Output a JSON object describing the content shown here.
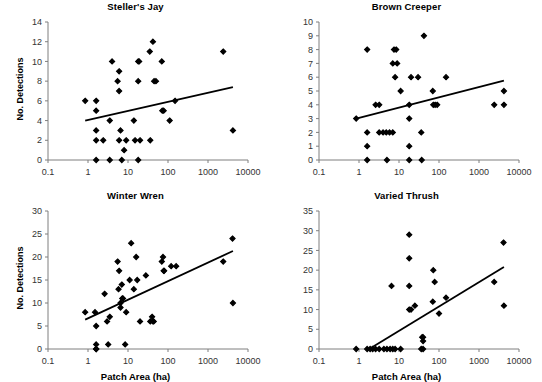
{
  "figure": {
    "width": 542,
    "height": 378,
    "background": "#ffffff",
    "marker_color": "#000000",
    "line_color": "#000000",
    "axis_color": "#7f7f7f",
    "tick_label_color": "#333333"
  },
  "axis_common": {
    "xlabel": "Patch Area (ha)",
    "ylabel": "No. Detections",
    "x_scale": "log",
    "x_ticks": [
      0.1,
      1,
      10,
      100,
      1000,
      10000
    ],
    "x_tick_labels": [
      "0.1",
      "1",
      "10",
      "100",
      "1000",
      "10000"
    ],
    "xlim": [
      0.1,
      10000
    ],
    "grid": false,
    "legend": false
  },
  "chart_data": [
    {
      "id": "stellers-jay",
      "type": "scatter",
      "title": "Steller's Jay",
      "xlabel": "",
      "ylabel": "No. Detections",
      "x_scale": "log",
      "xlim": [
        0.1,
        10000
      ],
      "ylim": [
        0,
        14
      ],
      "y_ticks": [
        0,
        2,
        4,
        6,
        8,
        10,
        12,
        14
      ],
      "y_tick_labels": [
        "0",
        "2",
        "4",
        "6",
        "8",
        "10",
        "12",
        "14"
      ],
      "x_ticks": [
        0.1,
        1,
        10,
        100,
        1000,
        10000
      ],
      "x_tick_labels": [
        "0.1",
        "1",
        "10",
        "100",
        "1000",
        "10000"
      ],
      "show_xlabel": false,
      "points": [
        [
          0.85,
          6
        ],
        [
          1.6,
          6
        ],
        [
          1.6,
          5
        ],
        [
          1.6,
          3
        ],
        [
          1.6,
          2
        ],
        [
          1.6,
          0
        ],
        [
          2.4,
          2
        ],
        [
          3.5,
          4
        ],
        [
          3.5,
          0
        ],
        [
          4.0,
          10
        ],
        [
          5.5,
          8
        ],
        [
          6.0,
          9
        ],
        [
          6.0,
          7
        ],
        [
          6.0,
          2
        ],
        [
          6.5,
          3
        ],
        [
          7.0,
          0
        ],
        [
          8.0,
          1
        ],
        [
          9.0,
          2
        ],
        [
          14,
          4
        ],
        [
          15,
          2
        ],
        [
          18,
          10
        ],
        [
          18,
          8
        ],
        [
          18,
          0
        ],
        [
          19,
          10
        ],
        [
          20,
          2
        ],
        [
          35,
          11
        ],
        [
          36,
          2
        ],
        [
          42,
          12
        ],
        [
          45,
          8
        ],
        [
          50,
          8
        ],
        [
          70,
          10
        ],
        [
          72,
          5
        ],
        [
          78,
          5
        ],
        [
          110,
          4
        ],
        [
          150,
          6
        ],
        [
          2400,
          11
        ],
        [
          4200,
          3
        ]
      ],
      "trend_line": {
        "x_start": 0.85,
        "y_start": 4.0,
        "x_end": 4200,
        "y_end": 7.4
      }
    },
    {
      "id": "brown-creeper",
      "type": "scatter",
      "title": "Brown Creeper",
      "xlabel": "",
      "ylabel": "",
      "x_scale": "log",
      "xlim": [
        0.1,
        10000
      ],
      "ylim": [
        0,
        10
      ],
      "y_ticks": [
        0,
        1,
        2,
        3,
        4,
        5,
        6,
        7,
        8,
        9,
        10
      ],
      "y_tick_labels": [
        "0",
        "1",
        "2",
        "3",
        "4",
        "5",
        "6",
        "7",
        "8",
        "9",
        "10"
      ],
      "x_ticks": [
        0.1,
        1,
        10,
        100,
        1000,
        10000
      ],
      "x_tick_labels": [
        "0.1",
        "1",
        "10",
        "100",
        "1000",
        "10000"
      ],
      "show_xlabel": false,
      "points": [
        [
          0.85,
          3
        ],
        [
          1.6,
          8
        ],
        [
          1.6,
          2
        ],
        [
          1.6,
          1
        ],
        [
          1.6,
          0
        ],
        [
          2.6,
          4
        ],
        [
          3.2,
          4
        ],
        [
          3.2,
          2
        ],
        [
          4.0,
          2
        ],
        [
          4.8,
          2
        ],
        [
          5.0,
          0
        ],
        [
          5.8,
          2
        ],
        [
          7.0,
          2
        ],
        [
          7.5,
          8
        ],
        [
          8.5,
          8
        ],
        [
          7.0,
          7
        ],
        [
          8.0,
          6
        ],
        [
          9.0,
          7
        ],
        [
          11,
          5
        ],
        [
          18,
          4
        ],
        [
          18,
          3
        ],
        [
          18,
          1
        ],
        [
          18,
          0
        ],
        [
          20,
          6
        ],
        [
          30,
          6
        ],
        [
          36,
          2
        ],
        [
          37,
          0
        ],
        [
          42,
          9
        ],
        [
          70,
          5
        ],
        [
          72,
          4
        ],
        [
          80,
          4
        ],
        [
          90,
          4
        ],
        [
          150,
          6
        ],
        [
          2400,
          4
        ],
        [
          4200,
          5
        ],
        [
          4200,
          4
        ]
      ],
      "trend_line": {
        "x_start": 0.85,
        "y_start": 3.0,
        "x_end": 4200,
        "y_end": 5.75
      }
    },
    {
      "id": "winter-wren",
      "type": "scatter",
      "title": "Winter Wren",
      "xlabel": "Patch Area (ha)",
      "ylabel": "No. Detections",
      "x_scale": "log",
      "xlim": [
        0.1,
        10000
      ],
      "ylim": [
        0,
        30
      ],
      "y_ticks": [
        0,
        5,
        10,
        15,
        20,
        25,
        30
      ],
      "y_tick_labels": [
        "0",
        "5",
        "10",
        "15",
        "20",
        "25",
        "30"
      ],
      "x_ticks": [
        0.1,
        1,
        10,
        100,
        1000,
        10000
      ],
      "x_tick_labels": [
        "0.1",
        "1",
        "10",
        "100",
        "1000",
        "10000"
      ],
      "show_xlabel": true,
      "points": [
        [
          0.85,
          8
        ],
        [
          1.5,
          8
        ],
        [
          1.6,
          5
        ],
        [
          1.6,
          1
        ],
        [
          1.6,
          0
        ],
        [
          1.6,
          0
        ],
        [
          2.6,
          12
        ],
        [
          3.0,
          6
        ],
        [
          3.2,
          1
        ],
        [
          3.5,
          7
        ],
        [
          5.5,
          19
        ],
        [
          5.8,
          13
        ],
        [
          6.0,
          17
        ],
        [
          6.5,
          10
        ],
        [
          6.5,
          9
        ],
        [
          7.0,
          14
        ],
        [
          7.2,
          11
        ],
        [
          7.5,
          11
        ],
        [
          8.5,
          1
        ],
        [
          9.0,
          8
        ],
        [
          11,
          15
        ],
        [
          12,
          23
        ],
        [
          14,
          13
        ],
        [
          16,
          20
        ],
        [
          17,
          15
        ],
        [
          20,
          6
        ],
        [
          28,
          16
        ],
        [
          36,
          6
        ],
        [
          40,
          7
        ],
        [
          42,
          6
        ],
        [
          44,
          6
        ],
        [
          70,
          19
        ],
        [
          75,
          20
        ],
        [
          78,
          17
        ],
        [
          80,
          17
        ],
        [
          120,
          18
        ],
        [
          160,
          18
        ],
        [
          2400,
          19
        ],
        [
          4100,
          24
        ],
        [
          4200,
          10
        ]
      ],
      "trend_line": {
        "x_start": 0.85,
        "y_start": 6.4,
        "x_end": 4200,
        "y_end": 21.3
      }
    },
    {
      "id": "varied-thrush",
      "type": "scatter",
      "title": "Varied Thrush",
      "xlabel": "Patch Area (ha)",
      "ylabel": "",
      "x_scale": "log",
      "xlim": [
        0.1,
        10000
      ],
      "ylim": [
        0,
        35
      ],
      "y_ticks": [
        0,
        5,
        10,
        15,
        20,
        25,
        30,
        35
      ],
      "y_tick_labels": [
        "0",
        "5",
        "10",
        "15",
        "20",
        "25",
        "30",
        "35"
      ],
      "x_ticks": [
        0.1,
        1,
        10,
        100,
        1000,
        10000
      ],
      "x_tick_labels": [
        "0.1",
        "1",
        "10",
        "100",
        "1000",
        "10000"
      ],
      "show_xlabel": true,
      "points": [
        [
          0.85,
          0
        ],
        [
          1.6,
          0
        ],
        [
          1.9,
          0
        ],
        [
          2.2,
          0
        ],
        [
          2.6,
          0
        ],
        [
          3.2,
          0
        ],
        [
          4.2,
          0
        ],
        [
          5.0,
          0
        ],
        [
          6.0,
          0
        ],
        [
          7.0,
          0
        ],
        [
          8.0,
          0
        ],
        [
          6.5,
          16
        ],
        [
          11,
          0
        ],
        [
          18,
          16
        ],
        [
          18,
          10
        ],
        [
          18,
          23
        ],
        [
          18,
          29
        ],
        [
          25,
          11
        ],
        [
          20,
          10
        ],
        [
          36,
          0
        ],
        [
          38,
          3
        ],
        [
          40,
          3
        ],
        [
          40,
          2
        ],
        [
          40,
          0
        ],
        [
          70,
          12
        ],
        [
          72,
          20
        ],
        [
          78,
          17
        ],
        [
          100,
          9
        ],
        [
          150,
          13
        ],
        [
          2400,
          17
        ],
        [
          4100,
          27
        ],
        [
          4200,
          11
        ]
      ],
      "trend_line": {
        "x_start": 1.8,
        "y_start": 0.0,
        "x_end": 4200,
        "y_end": 20.8
      }
    }
  ]
}
